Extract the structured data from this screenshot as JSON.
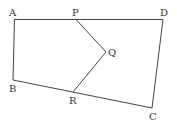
{
  "diagram": {
    "type": "geometry-figure",
    "stroke_color": "#444444",
    "label_color": "#333333",
    "points": {
      "A": {
        "label": "A",
        "x": 14.5,
        "y": 19.5
      },
      "P": {
        "label": "P",
        "x": 76,
        "y": 19.5
      },
      "D": {
        "label": "D",
        "x": 163,
        "y": 19.5
      },
      "Q": {
        "label": "Q",
        "x": 106,
        "y": 52
      },
      "B": {
        "label": "B",
        "x": 13,
        "y": 80
      },
      "R": {
        "label": "R",
        "x": 73,
        "y": 92
      },
      "C": {
        "label": "C",
        "x": 152,
        "y": 108
      }
    },
    "segments": [
      [
        "A",
        "D"
      ],
      [
        "D",
        "C"
      ],
      [
        "C",
        "B"
      ],
      [
        "B",
        "A"
      ],
      [
        "P",
        "Q"
      ],
      [
        "Q",
        "R"
      ]
    ]
  }
}
